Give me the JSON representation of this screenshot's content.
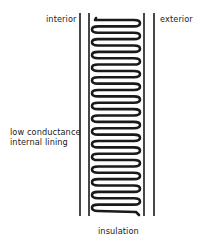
{
  "diagram": {
    "type": "wall-cross-section",
    "labels": {
      "interior": "interior",
      "exterior": "exterior",
      "lining_line1": "low conductance",
      "lining_line2": "internal lining",
      "insulation": "insulation"
    },
    "colors": {
      "ink": "#1a1a1a",
      "background": "#ffffff"
    },
    "walls": {
      "lines_x": [
        80,
        89,
        144,
        154
      ],
      "top_y": 13,
      "bottom_y": 216
    },
    "insulation_coil": {
      "left_x": 92,
      "right_x": 140,
      "start_y": 20,
      "end_y": 211,
      "loops": 15
    }
  }
}
